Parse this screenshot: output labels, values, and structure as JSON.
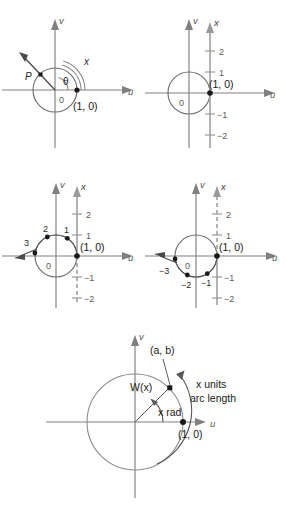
{
  "figure": {
    "axis_labels": {
      "horizontal": "u",
      "vertical": "v",
      "number_line": "x",
      "origin": "0"
    },
    "point_label": "(1, 0)"
  },
  "panels": [
    {
      "id": "panel-a",
      "name": "angle-theta-and-arc-x",
      "labels": {
        "v_axis": "v",
        "u_axis": "u",
        "origin": "0",
        "point_1_0": "(1, 0)",
        "point_P": "P",
        "angle": "θ",
        "arc": "x"
      }
    },
    {
      "id": "panel-b",
      "name": "number-line-tangent-at-one-zero",
      "labels": {
        "v_axis": "v",
        "u_axis": "u",
        "x_axis": "x",
        "origin": "0",
        "point_1_0": "(1, 0)"
      },
      "ticks": [
        "2",
        "1",
        "−1",
        "−2"
      ]
    },
    {
      "id": "panel-c",
      "name": "positive-wrap-counterclockwise",
      "labels": {
        "v_axis": "v",
        "u_axis": "u",
        "x_axis": "x",
        "origin": "0",
        "point_1_0": "(1, 0)"
      },
      "line_ticks": [
        "2",
        "1",
        "−1",
        "−2"
      ],
      "wrapped_points": [
        "1",
        "2",
        "3"
      ]
    },
    {
      "id": "panel-d",
      "name": "negative-wrap-clockwise",
      "labels": {
        "v_axis": "v",
        "u_axis": "u",
        "x_axis": "x",
        "origin": "0",
        "point_1_0": "(1, 0)"
      },
      "line_ticks": [
        "2",
        "1",
        "−1",
        "−2"
      ],
      "wrapped_points": [
        "−1",
        "−2",
        "−3"
      ]
    },
    {
      "id": "panel-e",
      "name": "wrapping-function-definition",
      "labels": {
        "v_axis": "v",
        "u_axis": "u",
        "point_1_0": "(1, 0)",
        "coords": "(a, b)",
        "function": "W(x)",
        "angle": "x rad",
        "arc_line1": "x units",
        "arc_line2": "arc length"
      }
    }
  ]
}
